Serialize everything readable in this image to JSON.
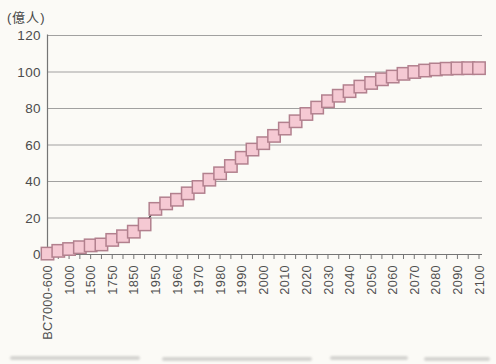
{
  "chart_data": {
    "type": "line",
    "title": "",
    "unit_label": "(億人)",
    "ylabel": "(億人)",
    "xlabel": "",
    "ylim": [
      0,
      120
    ],
    "yticks": [
      0,
      20,
      40,
      60,
      80,
      100,
      120
    ],
    "grid": true,
    "legend_position": "none",
    "marker": "square",
    "colors": {
      "background": "#fbfaf6",
      "marker_fill": "#f5c9d3",
      "marker_border": "#b2808e",
      "line": "#303030",
      "grid": "#979797",
      "axis": "#757575",
      "label": "#4f4f4f"
    },
    "points": [
      {
        "label": "BC7000-600",
        "value": 0.5
      },
      {
        "label": "",
        "value": 2
      },
      {
        "label": "1000",
        "value": 3
      },
      {
        "label": "",
        "value": 4
      },
      {
        "label": "1500",
        "value": 5
      },
      {
        "label": "",
        "value": 5.5
      },
      {
        "label": "1750",
        "value": 8
      },
      {
        "label": "",
        "value": 10
      },
      {
        "label": "1850",
        "value": 12.5
      },
      {
        "label": "",
        "value": 16.5
      },
      {
        "label": "1950",
        "value": 25
      },
      {
        "label": "",
        "value": 28
      },
      {
        "label": "1960",
        "value": 30
      },
      {
        "label": "",
        "value": 33.5
      },
      {
        "label": "1970",
        "value": 37
      },
      {
        "label": "",
        "value": 41
      },
      {
        "label": "1980",
        "value": 44.5
      },
      {
        "label": "",
        "value": 48.5
      },
      {
        "label": "1990",
        "value": 53
      },
      {
        "label": "",
        "value": 57.5
      },
      {
        "label": "2000",
        "value": 61
      },
      {
        "label": "",
        "value": 65
      },
      {
        "label": "2010",
        "value": 69
      },
      {
        "label": "",
        "value": 73
      },
      {
        "label": "2020",
        "value": 77
      },
      {
        "label": "",
        "value": 80.5
      },
      {
        "label": "2030",
        "value": 84
      },
      {
        "label": "",
        "value": 87
      },
      {
        "label": "2040",
        "value": 89.5
      },
      {
        "label": "",
        "value": 92
      },
      {
        "label": "2050",
        "value": 94
      },
      {
        "label": "",
        "value": 96
      },
      {
        "label": "2060",
        "value": 97.5
      },
      {
        "label": "",
        "value": 99
      },
      {
        "label": "2070",
        "value": 100
      },
      {
        "label": "",
        "value": 100.8
      },
      {
        "label": "2080",
        "value": 101.4
      },
      {
        "label": "",
        "value": 101.8
      },
      {
        "label": "2090",
        "value": 102
      },
      {
        "label": "",
        "value": 102.1
      },
      {
        "label": "2100",
        "value": 102.1
      }
    ]
  }
}
